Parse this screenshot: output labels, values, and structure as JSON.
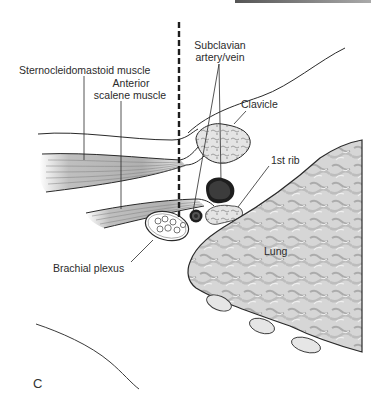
{
  "figure": {
    "panel_letter": "C",
    "labels": {
      "scm": "Sternocleidomastoid muscle",
      "anterior_scalene_1": "Anterior",
      "anterior_scalene_2": "scalene muscle",
      "subclavian_1": "Subclavian",
      "subclavian_2": "artery/vein",
      "clavicle": "Clavicle",
      "first_rib": "1st rib",
      "lung": "Lung",
      "brachial_plexus": "Brachial plexus"
    },
    "colors": {
      "line": "#2a2a2a",
      "vessel_dark": "#1e1e1e",
      "muscle": "#9a9a9a",
      "bone_fill": "#d8d8d8",
      "lung_fill": "#cfcfcf"
    }
  }
}
